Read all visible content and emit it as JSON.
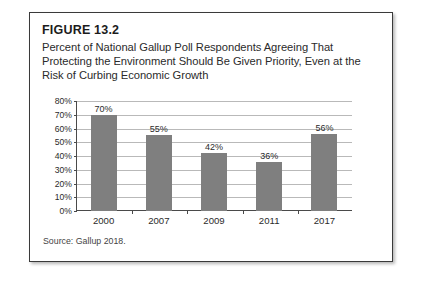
{
  "figure": {
    "label": "FIGURE 13.2",
    "caption": "Percent of National Gallup Poll Respondents Agreeing That Protecting the Environment Should Be Given Priority, Even at the Risk of Curbing Economic Growth",
    "source": "Source: Gallup 2018."
  },
  "colors": {
    "bar": "#7f7f7f",
    "gridline": "#b9b9b9",
    "axis": "#4a4a4a",
    "border": "#3a3a3a",
    "text": "#2b2b2b",
    "background": "#ffffff"
  },
  "chart_data": {
    "type": "bar",
    "title": "Percent of National Gallup Poll Respondents Agreeing That Protecting the Environment Should Be Given Priority, Even at the Risk of Curbing Economic Growth",
    "categories": [
      "2000",
      "2007",
      "2009",
      "2011",
      "2017"
    ],
    "values": [
      70,
      55,
      42,
      36,
      56
    ],
    "data_labels": [
      "70%",
      "55%",
      "42%",
      "36%",
      "56%"
    ],
    "xlabel": "",
    "ylabel": "",
    "ylim": [
      0,
      80
    ],
    "ytick_step": 10,
    "ytick_labels": [
      "0%",
      "10%",
      "20%",
      "30%",
      "40%",
      "50%",
      "60%",
      "70%",
      "80%"
    ],
    "ytick_values": [
      0,
      10,
      20,
      30,
      40,
      50,
      60,
      70,
      80
    ],
    "grid": true,
    "legend": false,
    "source": "Source: Gallup 2018."
  }
}
